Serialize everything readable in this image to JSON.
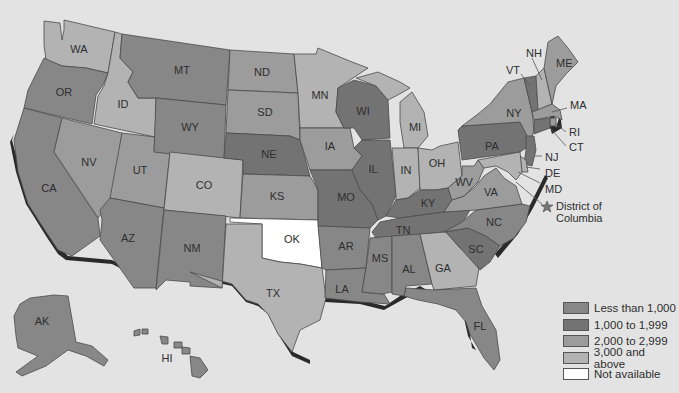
{
  "colors": {
    "background": "#e3e3e3",
    "cat_lt1000": "#878787",
    "cat_1000_1999": "#737373",
    "cat_2000_2999": "#9c9c9c",
    "cat_3000_up": "#b3b3b3",
    "cat_na": "#ffffff"
  },
  "legend": {
    "items": [
      {
        "key": "cat_lt1000",
        "label": "Less than 1,000",
        "color": "#878787"
      },
      {
        "key": "cat_1000_1999",
        "label": "1,000 to 1,999",
        "color": "#737373"
      },
      {
        "key": "cat_2000_2999",
        "label": "2,000 to 2,999",
        "color": "#9c9c9c"
      },
      {
        "key": "cat_3000_up",
        "label": "3,000 and above",
        "color": "#b3b3b3"
      },
      {
        "key": "cat_na",
        "label": "Not available",
        "color": "#ffffff"
      }
    ]
  },
  "states": [
    {
      "abbr": "WA",
      "cat": "cat_3000_up"
    },
    {
      "abbr": "OR",
      "cat": "cat_lt1000"
    },
    {
      "abbr": "CA",
      "cat": "cat_lt1000"
    },
    {
      "abbr": "ID",
      "cat": "cat_3000_up"
    },
    {
      "abbr": "NV",
      "cat": "cat_2000_2999"
    },
    {
      "abbr": "UT",
      "cat": "cat_2000_2999"
    },
    {
      "abbr": "AZ",
      "cat": "cat_lt1000"
    },
    {
      "abbr": "MT",
      "cat": "cat_lt1000"
    },
    {
      "abbr": "WY",
      "cat": "cat_lt1000"
    },
    {
      "abbr": "CO",
      "cat": "cat_3000_up"
    },
    {
      "abbr": "NM",
      "cat": "cat_lt1000"
    },
    {
      "abbr": "ND",
      "cat": "cat_2000_2999"
    },
    {
      "abbr": "SD",
      "cat": "cat_2000_2999"
    },
    {
      "abbr": "NE",
      "cat": "cat_1000_1999"
    },
    {
      "abbr": "KS",
      "cat": "cat_2000_2999"
    },
    {
      "abbr": "OK",
      "cat": "cat_na"
    },
    {
      "abbr": "TX",
      "cat": "cat_3000_up"
    },
    {
      "abbr": "MN",
      "cat": "cat_3000_up"
    },
    {
      "abbr": "IA",
      "cat": "cat_2000_2999"
    },
    {
      "abbr": "MO",
      "cat": "cat_1000_1999"
    },
    {
      "abbr": "AR",
      "cat": "cat_lt1000"
    },
    {
      "abbr": "LA",
      "cat": "cat_lt1000"
    },
    {
      "abbr": "WI",
      "cat": "cat_1000_1999"
    },
    {
      "abbr": "IL",
      "cat": "cat_1000_1999"
    },
    {
      "abbr": "MI",
      "cat": "cat_3000_up"
    },
    {
      "abbr": "IN",
      "cat": "cat_3000_up"
    },
    {
      "abbr": "OH",
      "cat": "cat_3000_up"
    },
    {
      "abbr": "KY",
      "cat": "cat_1000_1999"
    },
    {
      "abbr": "TN",
      "cat": "cat_1000_1999"
    },
    {
      "abbr": "MS",
      "cat": "cat_lt1000"
    },
    {
      "abbr": "AL",
      "cat": "cat_lt1000"
    },
    {
      "abbr": "GA",
      "cat": "cat_3000_up"
    },
    {
      "abbr": "FL",
      "cat": "cat_lt1000"
    },
    {
      "abbr": "SC",
      "cat": "cat_1000_1999"
    },
    {
      "abbr": "NC",
      "cat": "cat_lt1000"
    },
    {
      "abbr": "VA",
      "cat": "cat_2000_2999"
    },
    {
      "abbr": "WV",
      "cat": "cat_2000_2999"
    },
    {
      "abbr": "PA",
      "cat": "cat_1000_1999"
    },
    {
      "abbr": "NY",
      "cat": "cat_2000_2999"
    },
    {
      "abbr": "VT",
      "cat": "cat_1000_1999"
    },
    {
      "abbr": "NH",
      "cat": "cat_3000_up"
    },
    {
      "abbr": "ME",
      "cat": "cat_2000_2999"
    },
    {
      "abbr": "MA",
      "cat": "cat_2000_2999"
    },
    {
      "abbr": "RI",
      "cat": "cat_2000_2999"
    },
    {
      "abbr": "CT",
      "cat": "cat_1000_1999"
    },
    {
      "abbr": "NJ",
      "cat": "cat_1000_1999"
    },
    {
      "abbr": "DE",
      "cat": "cat_3000_up"
    },
    {
      "abbr": "MD",
      "cat": "cat_3000_up"
    },
    {
      "abbr": "AK",
      "cat": "cat_lt1000"
    },
    {
      "abbr": "HI",
      "cat": "cat_lt1000"
    }
  ],
  "callouts": {
    "NH": "NH",
    "VT": "VT",
    "ME": "ME",
    "MA": "MA",
    "RI": "RI",
    "CT": "CT",
    "NJ": "NJ",
    "DE": "DE",
    "MD": "MD",
    "DC_line1": "District of",
    "DC_line2": "Columbia"
  }
}
